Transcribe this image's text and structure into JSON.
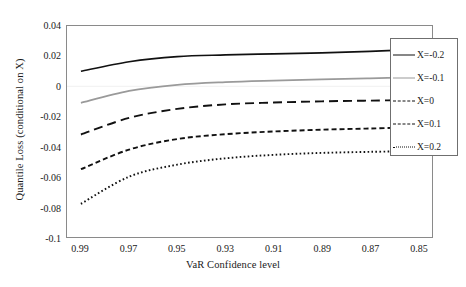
{
  "chart_data": {
    "type": "line",
    "title": "",
    "xlabel": "VaR Confidence level",
    "ylabel": "Quantile Loss (conditional on X)",
    "x": [
      0.99,
      0.97,
      0.95,
      0.93,
      0.91,
      0.89,
      0.87,
      0.85
    ],
    "xticklabels": [
      "0.99",
      "0.97",
      "0.95",
      "0.93",
      "0.91",
      "0.89",
      "0.87",
      "0.85"
    ],
    "xlim": [
      0.995,
      0.845
    ],
    "x_axis_reversed": true,
    "yticklabels": [
      "0.04",
      "0.02",
      "0",
      "-0.02",
      "-0.04",
      "-0.06",
      "-0.08",
      "-0.1"
    ],
    "yticks": [
      0.04,
      0.02,
      0,
      -0.02,
      -0.04,
      -0.06,
      -0.08,
      -0.1
    ],
    "ylim": [
      -0.1,
      0.04
    ],
    "grid": false,
    "legend_position": "right-inside",
    "series": [
      {
        "name": "X=-0.2",
        "style": "solid",
        "color": "#111111",
        "values": [
          0.01,
          0.0163,
          0.0197,
          0.0208,
          0.0215,
          0.0222,
          0.0232,
          0.0243
        ]
      },
      {
        "name": "X=-0.1",
        "style": "solid",
        "color": "#9a9a9a",
        "values": [
          -0.011,
          -0.003,
          0.001,
          0.0028,
          0.0038,
          0.0046,
          0.0053,
          0.006
        ]
      },
      {
        "name": "X=0",
        "style": "dashed-long",
        "color": "#111111",
        "values": [
          -0.032,
          -0.021,
          -0.015,
          -0.012,
          -0.0108,
          -0.01,
          -0.0095,
          -0.009
        ]
      },
      {
        "name": "X=0.1",
        "style": "dashed-short",
        "color": "#111111",
        "values": [
          -0.055,
          -0.042,
          -0.035,
          -0.0318,
          -0.03,
          -0.0288,
          -0.028,
          -0.0272
        ]
      },
      {
        "name": "X=0.2",
        "style": "dotted",
        "color": "#111111",
        "values": [
          -0.078,
          -0.06,
          -0.052,
          -0.0478,
          -0.0455,
          -0.0442,
          -0.0435,
          -0.043
        ]
      }
    ]
  },
  "legend": {
    "items": [
      {
        "label": "X=-0.2"
      },
      {
        "label": "X=-0.1"
      },
      {
        "label": "X=0"
      },
      {
        "label": "X=0.1"
      },
      {
        "label": "X=0.2"
      }
    ]
  }
}
